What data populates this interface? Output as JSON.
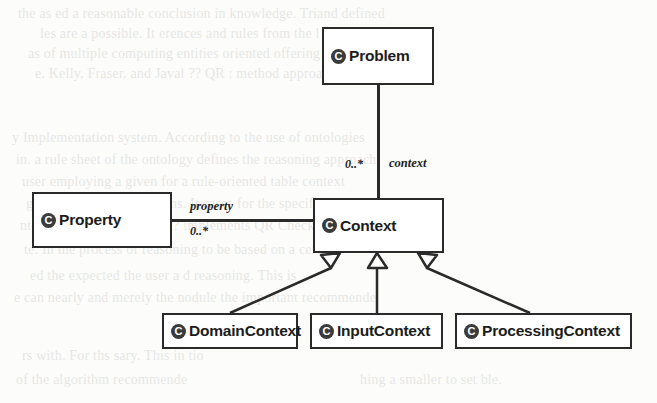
{
  "diagram": {
    "type": "uml-class-diagram",
    "classes": [
      {
        "id": "problem",
        "name": "Problem",
        "icon": "class-icon",
        "icon_letter": "C",
        "x": 322,
        "y": 27,
        "w": 112,
        "h": 58
      },
      {
        "id": "property",
        "name": "Property",
        "icon": "class-icon",
        "icon_letter": "C",
        "x": 32,
        "y": 192,
        "w": 140,
        "h": 56
      },
      {
        "id": "context",
        "name": "Context",
        "icon": "class-icon",
        "icon_letter": "C",
        "x": 313,
        "y": 198,
        "w": 131,
        "h": 55
      },
      {
        "id": "domaincontext",
        "name": "DomainContext",
        "icon": "class-icon",
        "icon_letter": "C",
        "x": 162,
        "y": 313,
        "w": 136,
        "h": 36
      },
      {
        "id": "inputcontext",
        "name": "InputContext",
        "icon": "class-icon",
        "icon_letter": "C",
        "x": 310,
        "y": 313,
        "w": 133,
        "h": 36
      },
      {
        "id": "processingcontext",
        "name": "ProcessingContext",
        "icon": "class-icon",
        "icon_letter": "C",
        "x": 455,
        "y": 313,
        "w": 177,
        "h": 36
      }
    ],
    "associations": [
      {
        "id": "problem-context",
        "from": "problem",
        "to": "context",
        "role_label": "context",
        "multiplicity": "0..*"
      },
      {
        "id": "property-context",
        "from": "property",
        "to": "context",
        "role_label": "property",
        "multiplicity": "0..*"
      }
    ],
    "generalizations": [
      {
        "id": "domaincontext-context",
        "subclass": "DomainContext",
        "superclass": "Context"
      },
      {
        "id": "inputcontext-context",
        "subclass": "InputContext",
        "superclass": "Context"
      },
      {
        "id": "processingcontext-context",
        "subclass": "ProcessingContext",
        "superclass": "Context"
      }
    ],
    "colors": {
      "line": "#2a2a2a",
      "box_fill": "#ffffff",
      "text": "#1c1c1c",
      "icon_fill": "#3b3b3b",
      "page": "#fcfcfa"
    }
  },
  "background_bleed": {
    "note": "faint show-through text from reverse of scanned page",
    "lines": [
      {
        "text": "the as ed a reasonable conclusion in knowledge. Triand defined",
        "x": 18,
        "y": 6
      },
      {
        "text": "les are a possible. It erences and rules from the l",
        "x": 40,
        "y": 26
      },
      {
        "text": "as of multiple computing entities oriented offering . the",
        "x": 28,
        "y": 46
      },
      {
        "text": "e. Kelly, Fraser, and Javal ?? QR : method approach",
        "x": 35,
        "y": 66
      },
      {
        "text": "y Implementation system. According to the use of ontologies",
        "x": 12,
        "y": 130
      },
      {
        "text": "in. a rule sheet of the ontology defines the reasoning approach",
        "x": 16,
        "y": 152
      },
      {
        "text": "user employing a given for a rule-oriented table context",
        "x": 22,
        "y": 174
      },
      {
        "text": "ge and specifies conditions. It cases for the specific",
        "x": 26,
        "y": 196
      },
      {
        "text": "ntext. For each rule used ?? implements QR Checkwa  con",
        "x": 20,
        "y": 218
      },
      {
        "text": "te. In the process of reasoning to be based on a certain",
        "x": 24,
        "y": 242
      },
      {
        "text": "ed the expected the user a d reasoning. This is",
        "x": 30,
        "y": 268
      },
      {
        "text": "e can nearly and merely the nodule the important recommende",
        "x": 14,
        "y": 290
      },
      {
        "text": "rs with. For ths sary. This in tio",
        "x": 22,
        "y": 348
      },
      {
        "text": "of the algorithm recommende",
        "x": 16,
        "y": 372
      },
      {
        "text": "hing a smaller to set ble.",
        "x": 360,
        "y": 372
      }
    ]
  }
}
